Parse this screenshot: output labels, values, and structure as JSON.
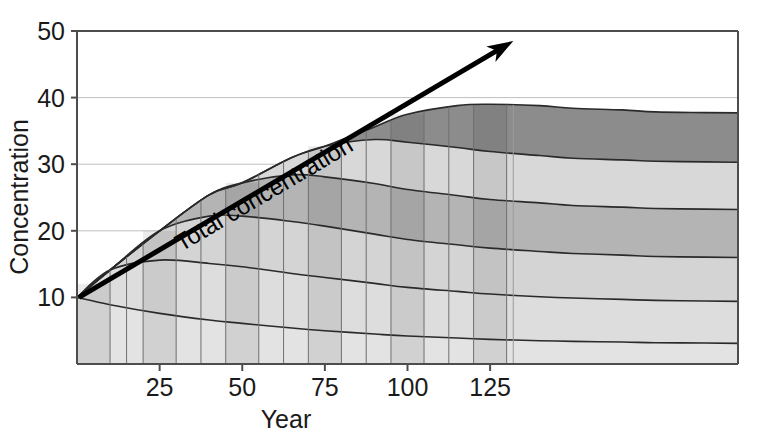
{
  "chart_data": {
    "type": "area",
    "title": "",
    "xlabel": "Year",
    "ylabel": "Concentration",
    "xlim": [
      0,
      200
    ],
    "ylim": [
      0,
      50
    ],
    "grid": true,
    "legend_position": "none",
    "xticks": [
      "25",
      "50",
      "75",
      "100",
      "125"
    ],
    "xtick_values": [
      25,
      50,
      75,
      100,
      125
    ],
    "yticks": [
      "10",
      "20",
      "30",
      "40",
      "50"
    ],
    "ytick_values": [
      10,
      20,
      30,
      40,
      50
    ],
    "annotations": [
      {
        "text": "Total concentration",
        "type": "arrow",
        "from": [
          0,
          10
        ],
        "to": [
          132,
          48.5
        ],
        "rotation_deg": -42
      }
    ],
    "x": [
      0,
      10,
      25,
      40,
      50,
      65,
      75,
      90,
      100,
      115,
      125,
      140,
      150,
      165,
      175,
      190,
      200
    ],
    "series": [
      {
        "name": "band-1",
        "color": "#e3e3e3",
        "values": [
          10.0,
          8.9,
          7.6,
          6.6,
          6.1,
          5.4,
          5.0,
          4.5,
          4.2,
          3.9,
          3.7,
          3.5,
          3.4,
          3.3,
          3.2,
          3.15,
          3.1
        ]
      },
      {
        "name": "band-2",
        "color": "#dddddd",
        "values": [
          0.0,
          5.2,
          8.0,
          8.5,
          8.5,
          8.2,
          8.0,
          7.6,
          7.3,
          7.0,
          6.8,
          6.6,
          6.5,
          6.4,
          6.35,
          6.3,
          6.3
        ]
      },
      {
        "name": "band-3",
        "color": "#d4d4d4",
        "values": [
          0.0,
          0.0,
          4.4,
          7.1,
          7.6,
          7.8,
          7.7,
          7.4,
          7.2,
          7.0,
          6.9,
          6.8,
          6.7,
          6.65,
          6.6,
          6.6,
          6.6
        ]
      },
      {
        "name": "band-4",
        "color": "#b4b4b4",
        "values": [
          0.0,
          0.0,
          0.0,
          3.2,
          5.0,
          7.0,
          7.4,
          7.6,
          7.5,
          7.4,
          7.3,
          7.3,
          7.2,
          7.2,
          7.2,
          7.2,
          7.2
        ]
      },
      {
        "name": "band-5",
        "color": "#d8d8d8",
        "values": [
          0.0,
          0.0,
          0.0,
          0.0,
          0.0,
          2.6,
          4.6,
          6.6,
          7.1,
          7.2,
          7.2,
          7.1,
          7.1,
          7.1,
          7.1,
          7.1,
          7.1
        ]
      },
      {
        "name": "band-6",
        "color": "#8c8c8c",
        "values": [
          0.0,
          0.0,
          0.0,
          0.0,
          0.0,
          0.0,
          0.0,
          1.9,
          4.2,
          6.3,
          7.1,
          7.5,
          7.5,
          7.5,
          7.4,
          7.4,
          7.4
        ]
      }
    ],
    "bar_slices": {
      "description": "Darker vertical stripes overlaid at each decade marker",
      "centers": [
        5,
        25,
        50,
        75,
        100,
        125
      ],
      "half_width": 5,
      "shade": "#00000014"
    }
  },
  "axes": {
    "y_axis_title": "Concentration",
    "x_axis_title": "Year",
    "axis_color": "#4d4d4d",
    "grid_color": "#bfbfbf"
  },
  "annotation": {
    "label": "Total concentration",
    "arrow_color": "#000000"
  }
}
